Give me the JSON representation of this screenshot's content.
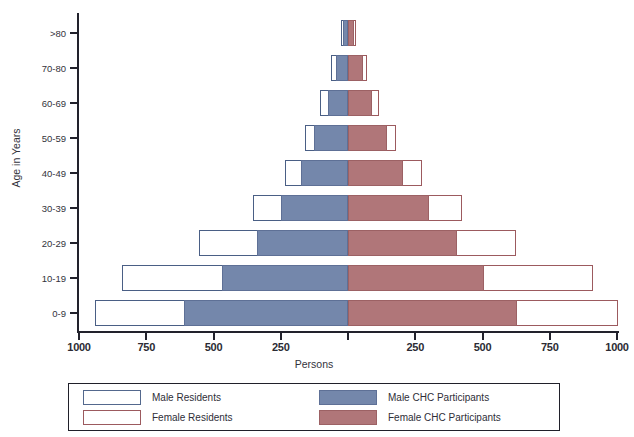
{
  "chart_data": {
    "type": "bar",
    "subtype": "population-pyramid",
    "title": "",
    "xlabel": "Persons",
    "ylabel": "Age in Years",
    "categories": [
      "0-9",
      "10-19",
      "20-29",
      "30-39",
      "40-49",
      "50-59",
      "60-69",
      "70-80",
      ">80"
    ],
    "category_order_top_to_bottom": [
      ">80",
      "70-80",
      "60-69",
      "50-59",
      "40-49",
      "30-39",
      "20-29",
      "10-19",
      "0-9"
    ],
    "xlim": [
      -1000,
      1000
    ],
    "xticks_left": [
      "1000",
      "750",
      "500",
      "250"
    ],
    "xticks_right": [
      "250",
      "500",
      "750",
      "1000"
    ],
    "xtick_values": [
      1000,
      750,
      500,
      250,
      250,
      500,
      750,
      1000
    ],
    "grid": false,
    "legend_position": "bottom",
    "series": [
      {
        "name": "Male Residents",
        "side": "left",
        "style": "outline",
        "color": "#53688d",
        "values": [
          940,
          840,
          555,
          355,
          235,
          160,
          105,
          65,
          25
        ]
      },
      {
        "name": "Male CHC Participants",
        "side": "left",
        "style": "filled",
        "color": "#7487ab",
        "values": [
          610,
          470,
          340,
          250,
          175,
          125,
          75,
          45,
          20
        ]
      },
      {
        "name": "Female Residents",
        "side": "right",
        "style": "outline",
        "color": "#9c5a5e",
        "values": [
          1005,
          910,
          625,
          425,
          275,
          180,
          115,
          70,
          28
        ]
      },
      {
        "name": "Female CHC Participants",
        "side": "right",
        "style": "filled",
        "color": "#b07679",
        "values": [
          630,
          505,
          405,
          300,
          205,
          145,
          90,
          55,
          22
        ]
      }
    ]
  },
  "axes": {
    "y_title": "Age in Years",
    "x_title": "Persons",
    "y_labels": [
      ">80",
      "70-80",
      "60-69",
      "50-59",
      "40-49",
      "30-39",
      "20-29",
      "10-19",
      "0-9"
    ],
    "x_labels": [
      "1000",
      "750",
      "500",
      "250",
      "250",
      "500",
      "750",
      "1000"
    ]
  },
  "legend": {
    "entries": [
      {
        "label": "Male Residents",
        "swatch": "outline-blue"
      },
      {
        "label": "Male CHC Participants",
        "swatch": "filled-blue"
      },
      {
        "label": "Female Residents",
        "swatch": "outline-red"
      },
      {
        "label": "Female CHC Participants",
        "swatch": "filled-red"
      }
    ]
  },
  "colors": {
    "male_outline": "#53688d",
    "male_fill": "#7487ab",
    "female_outline": "#9c5a5e",
    "female_fill": "#b07679",
    "axis": "#22222c",
    "background": "#ffffff"
  }
}
